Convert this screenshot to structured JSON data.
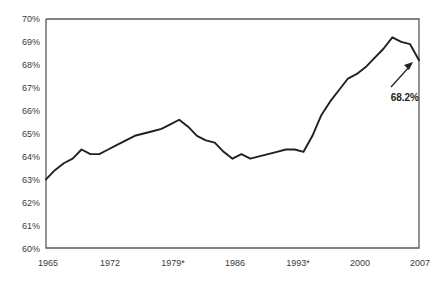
{
  "chart_data": {
    "type": "line",
    "title": "",
    "subtitle": "",
    "xlabel": "",
    "ylabel": "",
    "xlim": [
      1965,
      2007
    ],
    "ylim": [
      60,
      70
    ],
    "grid": false,
    "legend": "none",
    "y_tick_labels": [
      "70%",
      "69%",
      "68%",
      "67%",
      "66%",
      "65%",
      "64%",
      "63%",
      "62%",
      "61%",
      "60%"
    ],
    "y_tick_values": [
      70,
      69,
      68,
      67,
      66,
      65,
      64,
      63,
      62,
      61,
      60
    ],
    "x_tick_labels": [
      "1965",
      "1972",
      "1979*",
      "1986",
      "1993*",
      "2000",
      "2007"
    ],
    "x_tick_values": [
      1965,
      1972,
      1979,
      1986,
      1993,
      2000,
      2007
    ],
    "series": [
      {
        "name": "Homeownership rate",
        "x": [
          1965,
          1966,
          1967,
          1968,
          1969,
          1970,
          1971,
          1972,
          1973,
          1974,
          1975,
          1976,
          1977,
          1978,
          1979,
          1980,
          1981,
          1982,
          1983,
          1984,
          1985,
          1986,
          1987,
          1988,
          1989,
          1990,
          1991,
          1992,
          1993,
          1994,
          1995,
          1996,
          1997,
          1998,
          1999,
          2000,
          2001,
          2002,
          2003,
          2004,
          2005,
          2006,
          2007
        ],
        "values": [
          63.0,
          63.4,
          63.7,
          63.9,
          64.3,
          64.1,
          64.1,
          64.3,
          64.5,
          64.7,
          64.9,
          65.0,
          65.1,
          65.2,
          65.4,
          65.6,
          65.3,
          64.9,
          64.7,
          64.6,
          64.2,
          63.9,
          64.1,
          63.9,
          64.0,
          64.1,
          64.2,
          64.3,
          64.3,
          64.2,
          64.9,
          65.8,
          66.4,
          66.9,
          67.4,
          67.6,
          67.9,
          68.3,
          68.7,
          69.2,
          69.0,
          68.9,
          68.2
        ]
      }
    ],
    "annotations": [
      {
        "name": "end-value-callout",
        "label": "68.2%",
        "x": 2007,
        "y": 68.2
      }
    ]
  },
  "axes": {
    "left_axis_name": "y-axis",
    "bottom_axis_name": "x-axis"
  }
}
